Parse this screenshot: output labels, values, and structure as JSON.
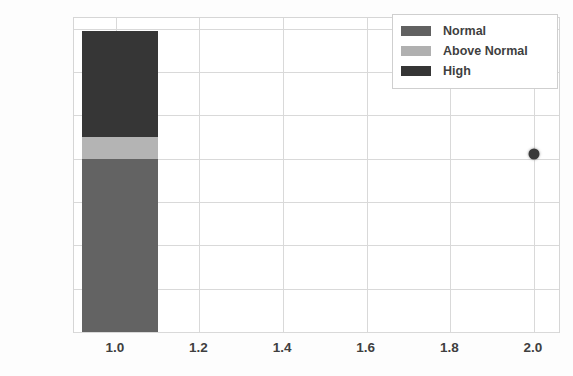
{
  "chart_data": {
    "type": "bar",
    "title": "",
    "xlabel": "",
    "ylabel": "diastolic, mm Hg",
    "xlim": [
      0.9,
      2.06
    ],
    "ylim": [
      0,
      145
    ],
    "grid": true,
    "legend_position": "top-right",
    "yticks": [
      0,
      20,
      40,
      60,
      80,
      100,
      120,
      140
    ],
    "ytick_labels": [
      "0",
      "20",
      "40",
      "60",
      "80",
      "100",
      "120",
      "140"
    ],
    "xticks": [
      1.0,
      1.2,
      1.4,
      1.6,
      1.8,
      2.0
    ],
    "xtick_labels": [
      "1.0",
      "1.2",
      "1.4",
      "1.6",
      "1.8",
      "2.0"
    ],
    "stacked_bar": {
      "x_center": 1.01,
      "x_left": 0.92,
      "x_right": 1.1,
      "segments": [
        {
          "name": "Normal",
          "y_from": 0,
          "y_to": 80,
          "value": 80,
          "color": "#5f5f5f"
        },
        {
          "name": "Above Normal",
          "y_from": 80,
          "y_to": 90,
          "value": 10,
          "color": "#b4b4b4"
        },
        {
          "name": "High",
          "y_from": 90,
          "y_to": 139,
          "value": 49,
          "color": "#2f2f2f"
        }
      ]
    },
    "points": [
      {
        "x": 2.0,
        "y": 82,
        "color": "#3a3a3a",
        "marker": "circle"
      }
    ],
    "series": [
      {
        "name": "Normal",
        "values": [
          80
        ],
        "color": "#5f5f5f"
      },
      {
        "name": "Above Normal",
        "values": [
          10
        ],
        "color": "#b4b4b4"
      },
      {
        "name": "High",
        "values": [
          49
        ],
        "color": "#2f2f2f"
      }
    ],
    "categories": [
      "1.0"
    ]
  },
  "legend": {
    "items": [
      {
        "label": "Normal",
        "color": "#5f5f5f"
      },
      {
        "label": "Above Normal",
        "color": "#b4b4b4"
      },
      {
        "label": "High",
        "color": "#2f2f2f"
      }
    ]
  },
  "colors": {
    "grid": "#d9d9d9",
    "axis_border": "#d6d6d6",
    "plot_background": "#ffffff",
    "figure_background": "#fdfdfd",
    "tick_text": "#3f3f3f"
  }
}
